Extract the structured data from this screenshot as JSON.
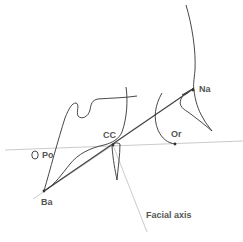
{
  "diagram": {
    "colors": {
      "tracing": "#333333",
      "reference_line": "#bbbbbb",
      "label": "#555555",
      "background": "#ffffff"
    },
    "landmarks": [
      {
        "id": "na",
        "label": "Na",
        "x": 193,
        "y": 90
      },
      {
        "id": "or",
        "label": "Or",
        "x": 175,
        "y": 144
      },
      {
        "id": "cc",
        "label": "CC",
        "x": 113,
        "y": 145
      },
      {
        "id": "po",
        "label": "Po",
        "x": 35,
        "y": 155
      },
      {
        "id": "ba",
        "label": "Ba",
        "x": 44,
        "y": 191
      }
    ],
    "lines": [
      {
        "id": "frankfort-horizontal",
        "from": [
          5,
          150
        ],
        "to": [
          243,
          141
        ]
      },
      {
        "id": "ba-na-line",
        "from": [
          44,
          191
        ],
        "to": [
          193,
          89
        ]
      },
      {
        "id": "facial-axis-line",
        "from": [
          113,
          145
        ],
        "to": [
          147,
          232
        ]
      }
    ],
    "annotation": {
      "label": "Facial axis"
    }
  }
}
